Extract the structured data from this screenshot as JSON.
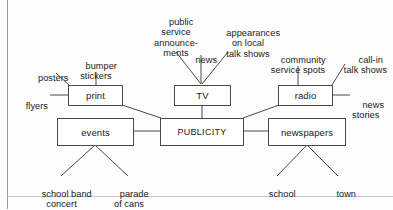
{
  "diagram": {
    "type": "concept-map",
    "title": "PUBLICITY",
    "frame": {
      "left_border_color": "#9a9a9a"
    },
    "center": {
      "id": "publicity",
      "label": "PUBLICITY"
    },
    "primary_nodes": [
      {
        "id": "print",
        "label": "print"
      },
      {
        "id": "tv",
        "label": "TV"
      },
      {
        "id": "radio",
        "label": "radio"
      },
      {
        "id": "events",
        "label": "events"
      },
      {
        "id": "newspapers",
        "label": "newspapers"
      }
    ],
    "leaf_labels": [
      {
        "id": "posters",
        "parent": "print",
        "text": "posters"
      },
      {
        "id": "bumper-stickers",
        "parent": "print",
        "text": "bumper\nstickers"
      },
      {
        "id": "flyers",
        "parent": "print",
        "text": "flyers"
      },
      {
        "id": "public-service-announcements",
        "parent": "tv",
        "text": "public\nservice\nannounce-\nments"
      },
      {
        "id": "news",
        "parent": "tv",
        "text": "news"
      },
      {
        "id": "appearances-on-local-talk-shows",
        "parent": "tv",
        "text": "appearances\non local\ntalk shows"
      },
      {
        "id": "community-service-spots",
        "parent": "radio",
        "text": "community\nservice spots"
      },
      {
        "id": "call-in-talk-shows",
        "parent": "radio",
        "text": "call-in\ntalk shows"
      },
      {
        "id": "news-stories",
        "parent": "radio",
        "text": "news\nstories"
      },
      {
        "id": "school-band-concert",
        "parent": "events",
        "text": "school band\nconcert"
      },
      {
        "id": "parade-of-cans",
        "parent": "events",
        "text": "parade\nof cans"
      },
      {
        "id": "school",
        "parent": "newspapers",
        "text": "school"
      },
      {
        "id": "town",
        "parent": "newspapers",
        "text": "town"
      }
    ],
    "colors": {
      "line": "#4a4a4a",
      "text": "#1a1a1a",
      "background": "#fdfdfd",
      "frame": "#9a9a9a"
    }
  }
}
